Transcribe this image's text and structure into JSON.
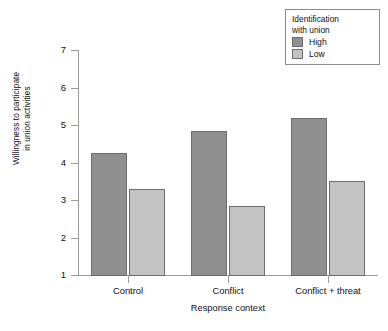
{
  "chart_data": {
    "type": "bar",
    "title": "",
    "xlabel": "Response context",
    "ylabel": "Willingness to participate in union activities",
    "ylabel_line1": "Willingness to participate",
    "ylabel_line2": "in union activities",
    "categories": [
      "Control",
      "Conflict",
      "Conflict + threat"
    ],
    "ylim": [
      1,
      7
    ],
    "yticks": [
      1,
      2,
      3,
      4,
      5,
      6,
      7
    ],
    "grid": false,
    "legend_position": "top-right",
    "legend_title": "Identification with union",
    "legend_title_line1": "Identification",
    "legend_title_line2": "with union",
    "series": [
      {
        "name": "High",
        "color": "#8f8f8f",
        "values": [
          4.25,
          4.85,
          5.2
        ]
      },
      {
        "name": "Low",
        "color": "#c3c3c3",
        "values": [
          3.3,
          2.85,
          3.5
        ]
      }
    ]
  },
  "axis": {
    "y_tick_labels": [
      "7",
      "6",
      "5",
      "4",
      "3",
      "2",
      "1"
    ]
  }
}
